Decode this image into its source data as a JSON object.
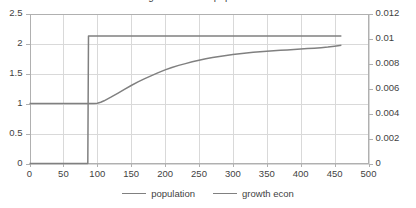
{
  "chart_data": {
    "type": "line",
    "title": "growth econ e popolazione",
    "xlabel": "",
    "ylabel": "",
    "grid": true,
    "legend_position": "bottom",
    "xlim": [
      0,
      500
    ],
    "xticks": [
      0,
      50,
      100,
      150,
      200,
      250,
      300,
      350,
      400,
      450,
      500
    ],
    "y_left": {
      "label": "",
      "ylim": [
        0,
        2.5
      ],
      "ticks": [
        0,
        0.5,
        1,
        1.5,
        2,
        2.5
      ],
      "ticklabels": [
        "0",
        "0.5",
        "1",
        "1.5",
        "2",
        "2.5"
      ]
    },
    "y_right": {
      "label": "",
      "ylim": [
        0,
        0.012
      ],
      "ticks": [
        0,
        0.002,
        0.004,
        0.006,
        0.008,
        0.01,
        0.012
      ],
      "ticklabels": [
        "0",
        "0.002",
        "0.004",
        "0.006",
        "0.008",
        "0.01",
        "0.012"
      ]
    },
    "series": [
      {
        "name": "population",
        "axis": "left",
        "color": "#808080",
        "x": [
          0,
          20,
          40,
          60,
          80,
          87,
          90,
          95,
          100,
          105,
          110,
          120,
          130,
          140,
          150,
          160,
          170,
          180,
          190,
          200,
          210,
          220,
          230,
          240,
          250,
          260,
          270,
          280,
          290,
          300,
          310,
          320,
          330,
          340,
          350,
          360,
          370,
          380,
          390,
          400,
          410,
          420,
          430,
          440,
          450,
          460
        ],
        "y": [
          1.0,
          1.0,
          1.0,
          1.0,
          1.0,
          1.0,
          1.0,
          1.0,
          1.005,
          1.02,
          1.045,
          1.105,
          1.17,
          1.235,
          1.3,
          1.36,
          1.415,
          1.465,
          1.515,
          1.56,
          1.6,
          1.635,
          1.665,
          1.695,
          1.72,
          1.745,
          1.765,
          1.785,
          1.8,
          1.815,
          1.83,
          1.842,
          1.853,
          1.862,
          1.871,
          1.879,
          1.886,
          1.893,
          1.9,
          1.907,
          1.915,
          1.922,
          1.93,
          1.94,
          1.955,
          1.97
        ]
      },
      {
        "name": "growth econ",
        "axis": "right",
        "color": "#808080",
        "x": [
          0,
          20,
          40,
          60,
          80,
          86,
          87,
          100,
          150,
          200,
          250,
          300,
          350,
          400,
          450,
          460
        ],
        "y": [
          0,
          0,
          0,
          0,
          0,
          0,
          0.0102,
          0.0102,
          0.0102,
          0.0102,
          0.0102,
          0.0102,
          0.0102,
          0.0102,
          0.0102,
          0.0102
        ]
      }
    ],
    "legend": [
      {
        "label": "population",
        "color": "#808080"
      },
      {
        "label": "growth econ",
        "color": "#808080"
      }
    ]
  },
  "colors": {
    "grid": "#d9d9d9",
    "axis": "#b0b0b0",
    "text": "#3f3f3f",
    "series": "#808080",
    "background": "#ffffff"
  }
}
